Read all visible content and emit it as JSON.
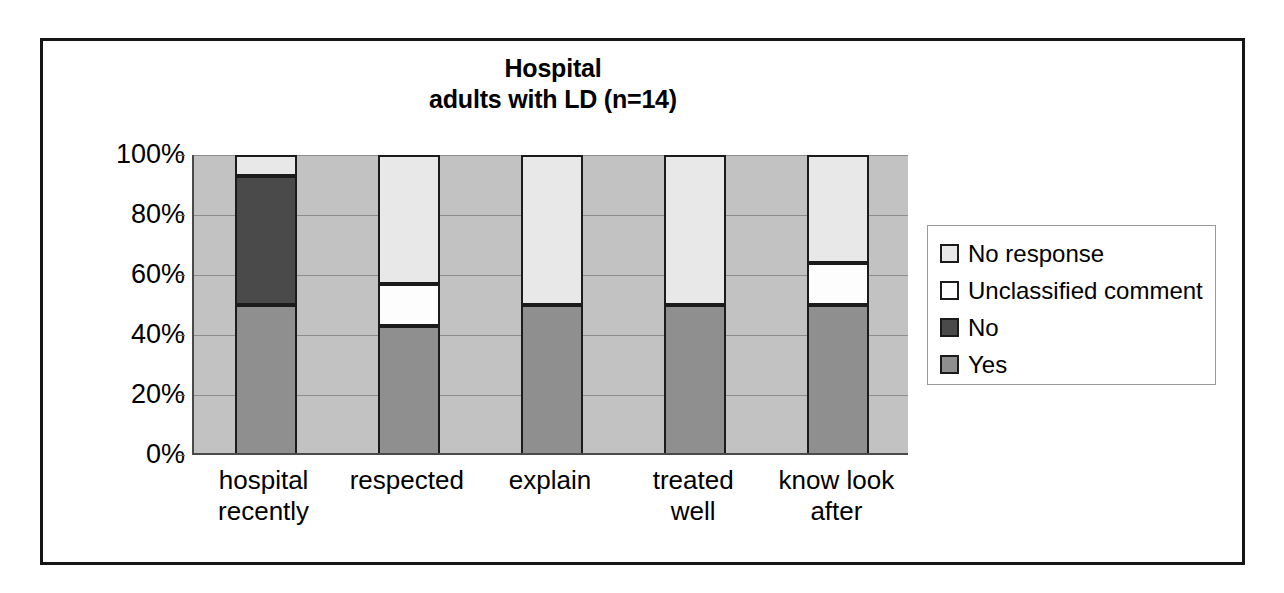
{
  "chart_data": {
    "type": "bar",
    "subtype": "100-percent-stacked-vertical",
    "title": "Hospital",
    "subtitle": "adults with LD (n=14)",
    "xlabel": "",
    "ylabel": "",
    "ylim": [
      0,
      100
    ],
    "yticks": [
      "0%",
      "20%",
      "40%",
      "60%",
      "80%",
      "100%"
    ],
    "ytick_values": [
      0,
      20,
      40,
      60,
      80,
      100
    ],
    "grid": true,
    "legend_position": "right",
    "categories": [
      "hospital recently",
      "respected",
      "explain",
      "treated well",
      "know look after"
    ],
    "category_lines": [
      [
        "hospital",
        "recently"
      ],
      [
        "respected"
      ],
      [
        "explain"
      ],
      [
        "treated",
        "well"
      ],
      [
        "know look",
        "after"
      ]
    ],
    "series": [
      {
        "name": "Yes",
        "color": "#8f8f8f",
        "values": [
          50,
          43,
          50,
          50,
          50
        ]
      },
      {
        "name": "No",
        "color": "#4a4a4a",
        "values": [
          43,
          0,
          0,
          0,
          0
        ]
      },
      {
        "name": "Unclassified comment",
        "color": "#fdfdfd",
        "values": [
          0,
          14,
          0,
          0,
          14
        ]
      },
      {
        "name": "No response",
        "color": "#e8e8e8",
        "values": [
          7,
          43,
          50,
          50,
          36
        ]
      }
    ],
    "legend_entries": [
      {
        "label": "No response",
        "color": "#e8e8e8"
      },
      {
        "label": "Unclassified comment",
        "color": "#fdfdfd"
      },
      {
        "label": "No",
        "color": "#4a4a4a"
      },
      {
        "label": "Yes",
        "color": "#8f8f8f"
      }
    ],
    "plot_background": "#c2c2c2",
    "gridline_color": "#8d8d8d",
    "bar_outline_color": "#1b1b1b",
    "frame_color": "#151515"
  }
}
